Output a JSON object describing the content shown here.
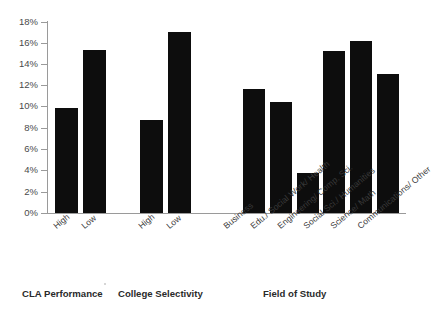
{
  "chart_data": {
    "type": "bar",
    "title": "",
    "xlabel": "",
    "ylabel": "",
    "ylim": [
      0,
      18
    ],
    "ytick_values": [
      0,
      2,
      4,
      6,
      8,
      10,
      12,
      14,
      16,
      18
    ],
    "ytick_labels": [
      "0%",
      "2%",
      "4%",
      "6%",
      "8%",
      "10%",
      "12%",
      "14%",
      "16%",
      "18%"
    ],
    "grid": false,
    "legend": "none",
    "orientation": "vertical",
    "bar_color": "#0d0d0d",
    "axis_color": "#9a9a9a",
    "value_unit": "%",
    "groups": [
      {
        "name": "CLA Performance",
        "categories": [
          "High",
          "Low"
        ],
        "values": [
          9.9,
          15.4
        ]
      },
      {
        "name": "College Selectivity",
        "categories": [
          "High",
          "Low"
        ],
        "values": [
          8.8,
          17.1
        ]
      },
      {
        "name": "Field of Study",
        "categories": [
          "Business",
          "Edu./ Social Work/ Health",
          "Engineering/ Comp. Sci.",
          "Social Sci./ Humanities",
          "Science/ Math",
          "Communications/ Other"
        ],
        "values": [
          11.7,
          10.5,
          3.8,
          15.3,
          16.2,
          13.1
        ]
      }
    ],
    "categories": [
      "High",
      "Low",
      "High",
      "Low",
      "Business",
      "Edu./ Social Work/ Health",
      "Engineering/ Comp. Sci.",
      "Social Sci./ Humanities",
      "Science/ Math",
      "Communications/ Other"
    ],
    "values": [
      9.9,
      15.4,
      8.8,
      17.1,
      11.7,
      10.5,
      3.8,
      15.3,
      16.2,
      13.1
    ]
  },
  "axis": {
    "y_labels": [
      "18%",
      "16%",
      "14%",
      "12%",
      "10%",
      "8%",
      "6%",
      "4%",
      "2%",
      "0%"
    ]
  },
  "group_titles": {
    "g1": "CLA Performance",
    "g2": "College Selectivity",
    "g3": "Field of Study"
  },
  "cat_labels": {
    "c0": "High",
    "c1": "Low",
    "c2": "High",
    "c3": "Low",
    "c4": "Business",
    "c5": "Edu./ Social Work/ Health",
    "c6": "Engineering/ Comp. Sci.",
    "c7": "Social Sci./ Humanities",
    "c8": "Science/ Math",
    "c9": "Communications/ Other"
  }
}
